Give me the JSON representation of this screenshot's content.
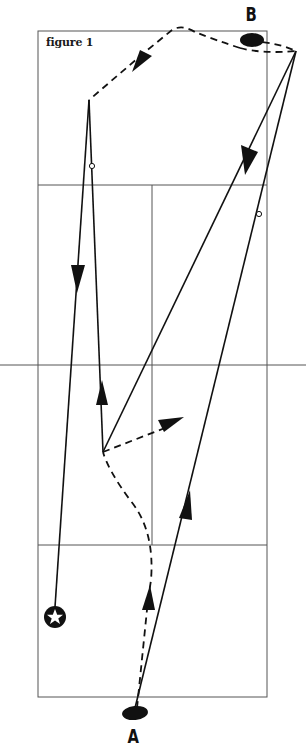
{
  "figure": {
    "caption": "figure 1",
    "labels": {
      "a": "A",
      "b": "B"
    }
  },
  "colors": {
    "background": "#ffffff",
    "court_line": "#555555",
    "path_line": "#111111"
  },
  "court": {
    "outer": {
      "x": 38,
      "y": 31,
      "width": 229,
      "height": 666
    },
    "service_line_top_y": 185,
    "net_y": 365,
    "service_line_bottom_y": 545,
    "center_line_x": 152
  },
  "markers": {
    "player_a": {
      "cx": 135,
      "cy": 713,
      "label": "A"
    },
    "player_b": {
      "cx": 252,
      "cy": 40,
      "label": "B"
    },
    "target_star": {
      "cx": 55,
      "cy": 617
    },
    "open_circles": [
      {
        "cx": 92,
        "cy": 166
      },
      {
        "cx": 259,
        "cy": 214
      }
    ]
  },
  "paths": {
    "solid": [
      "A to far-right corner (up-right)",
      "far-right corner to pivot (down-left, arrow)",
      "pivot up to left corner",
      "left corner down to star (arrow)"
    ],
    "dashed": [
      "A up to pivot (curved, arrow)",
      "pivot to right (arrow)",
      "B to far-right corner",
      "B over top to left corner (arrow)"
    ]
  }
}
